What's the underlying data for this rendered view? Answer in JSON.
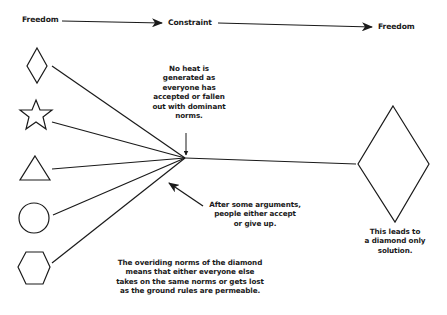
{
  "diagram": {
    "flow": {
      "stages": [
        "Freedom",
        "Constraint",
        "Freedom"
      ]
    },
    "shapes": {
      "inputs": [
        "diamond",
        "star",
        "triangle",
        "circle",
        "hexagon"
      ],
      "output": "diamond"
    },
    "annotations": {
      "no_heat": "No heat is\ngenerated as\neveryone has\naccepted or fallen\nout with dominant\nnorms.",
      "arguments": "After some arguments,\npeople either accept\nor give up.",
      "overriding_norms": "The overiding norms of the diamond\nmeans that either everyone else\ntakes on the same norms or gets lost\nas the ground rules are permeable.",
      "outcome": "This leads to\na diamond only\nsolution."
    },
    "colors": {
      "ink": "#1a1a1a",
      "background": "#ffffff"
    }
  }
}
